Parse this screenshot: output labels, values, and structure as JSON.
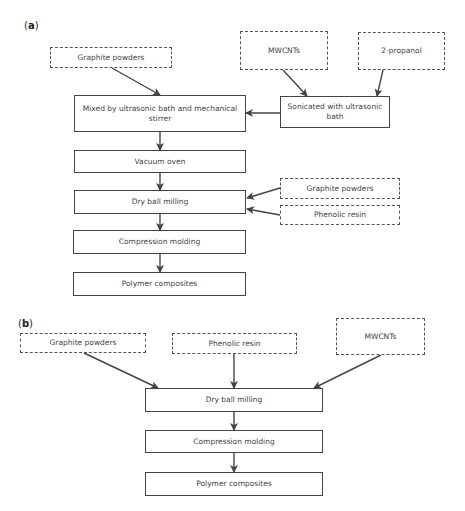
{
  "panel_a": {
    "label_open": "(",
    "label_letter": "a",
    "label_close": ")",
    "inputs": {
      "graphite_powders": "Graphite powders",
      "mwcnts": "MWCNTs",
      "propanol": "2-propanol",
      "graphite_powders_2": "Graphite powders",
      "phenolic_resin": "Phenolic resin"
    },
    "steps": {
      "sonicated": "Sonicated with ultrasonic bath",
      "mixed": "Mixed by ultrasonic bath and mechanical stirrer",
      "vacuum_oven": "Vacuum oven",
      "dry_ball_milling": "Dry ball milling",
      "compression_molding": "Compression molding",
      "polymer_composites": "Polymer composites"
    }
  },
  "panel_b": {
    "label_open": "(",
    "label_letter": "b",
    "label_close": ")",
    "inputs": {
      "graphite_powders": "Graphite powders",
      "phenolic_resin": "Phenolic resin",
      "mwcnts": "MWCNTs"
    },
    "steps": {
      "dry_ball_milling": "Dry ball milling",
      "compression_molding": "Compression molding",
      "polymer_composites": "Polymer composites"
    }
  },
  "colors": {
    "line": "#444444",
    "text": "#444444",
    "background": "#ffffff"
  }
}
